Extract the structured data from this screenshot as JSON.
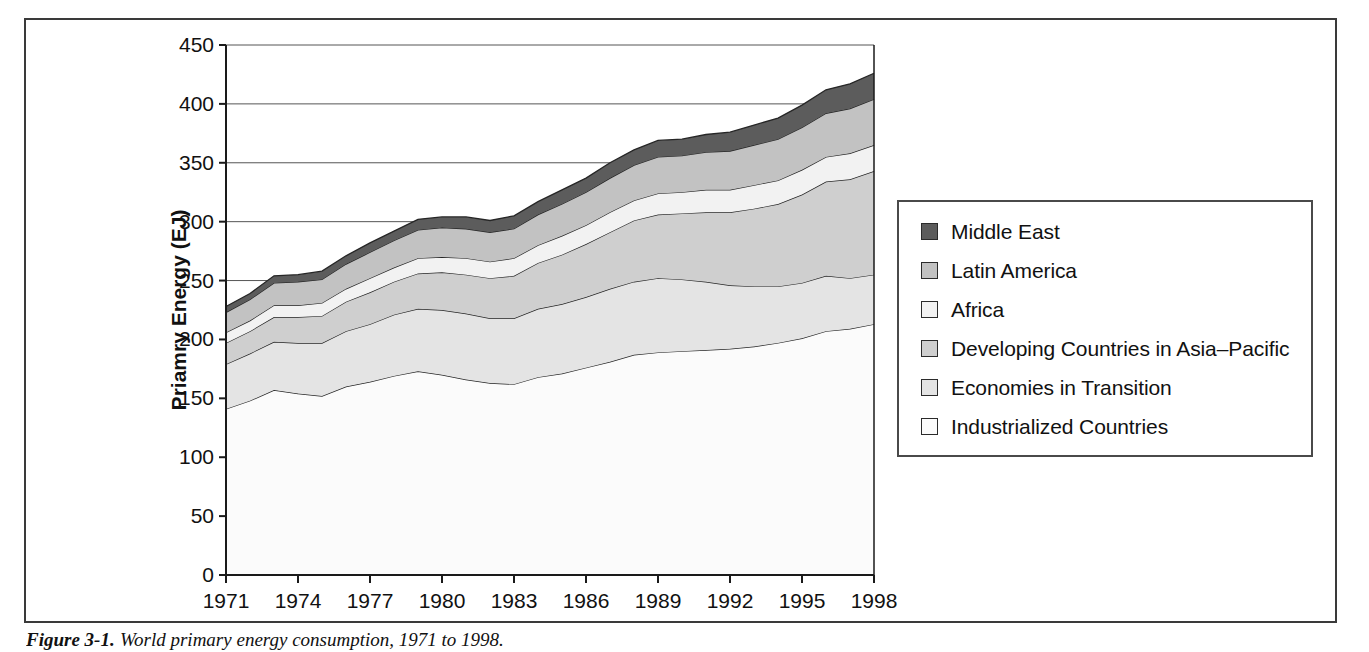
{
  "figure": {
    "caption_number": "Figure 3-1.",
    "caption_text": "World primary energy consumption, 1971 to 1998."
  },
  "legend": {
    "items": [
      {
        "label": "Middle East",
        "color": "#5c5c5c"
      },
      {
        "label": "Latin America",
        "color": "#c2c2c2"
      },
      {
        "label": "Africa",
        "color": "#f2f2f2"
      },
      {
        "label": "Developing Countries in Asia–Pacific",
        "color": "#cfcfcf"
      },
      {
        "label": "Economies in Transition",
        "color": "#e4e4e4"
      },
      {
        "label": "Industrialized Countries",
        "color": "#fbfbfb"
      }
    ]
  },
  "chart_data": {
    "type": "area",
    "stacked": true,
    "title": "",
    "xlabel": "",
    "ylabel": "Priamry Energy (EJ)",
    "ylim": [
      0,
      450
    ],
    "ytick_step": 50,
    "yticks": [
      0,
      50,
      100,
      150,
      200,
      250,
      300,
      350,
      400,
      450
    ],
    "xlim": [
      1971,
      1998
    ],
    "xticks": [
      1971,
      1974,
      1977,
      1980,
      1983,
      1986,
      1989,
      1992,
      1995,
      1998
    ],
    "x": [
      1971,
      1972,
      1973,
      1974,
      1975,
      1976,
      1977,
      1978,
      1979,
      1980,
      1981,
      1982,
      1983,
      1984,
      1985,
      1986,
      1987,
      1988,
      1989,
      1990,
      1991,
      1992,
      1993,
      1994,
      1995,
      1996,
      1997,
      1998
    ],
    "grid": "horizontal",
    "legend_position": "right-outside",
    "series": [
      {
        "name": "Industrialized Countries",
        "color": "#fbfbfb",
        "values": [
          141,
          148,
          157,
          154,
          152,
          160,
          164,
          169,
          173,
          170,
          166,
          163,
          162,
          168,
          171,
          176,
          181,
          187,
          189,
          190,
          191,
          192,
          194,
          197,
          201,
          207,
          209,
          213
        ]
      },
      {
        "name": "Economies in Transition",
        "color": "#e4e4e4",
        "values": [
          38,
          40,
          41,
          43,
          45,
          47,
          49,
          52,
          53,
          55,
          56,
          55,
          56,
          58,
          59,
          60,
          62,
          62,
          63,
          61,
          58,
          54,
          51,
          48,
          47,
          47,
          43,
          42
        ]
      },
      {
        "name": "Developing Countries in Asia–Pacific",
        "color": "#cfcfcf",
        "values": [
          18,
          19,
          21,
          22,
          23,
          25,
          27,
          28,
          30,
          32,
          33,
          34,
          36,
          39,
          42,
          45,
          48,
          52,
          54,
          56,
          59,
          62,
          66,
          70,
          75,
          80,
          84,
          88
        ]
      },
      {
        "name": "Africa",
        "color": "#f2f2f2",
        "values": [
          9,
          9,
          10,
          10,
          11,
          11,
          12,
          12,
          13,
          13,
          14,
          14,
          15,
          15,
          16,
          16,
          17,
          17,
          18,
          18,
          19,
          19,
          20,
          20,
          21,
          21,
          22,
          22
        ]
      },
      {
        "name": "Latin America",
        "color": "#c2c2c2",
        "values": [
          17,
          18,
          19,
          20,
          20,
          21,
          22,
          23,
          24,
          25,
          25,
          25,
          25,
          26,
          27,
          28,
          29,
          30,
          31,
          31,
          32,
          33,
          34,
          35,
          36,
          37,
          38,
          39
        ]
      },
      {
        "name": "Middle East",
        "color": "#5c5c5c",
        "values": [
          5,
          5,
          6,
          6,
          7,
          7,
          8,
          8,
          9,
          9,
          10,
          10,
          11,
          11,
          12,
          12,
          13,
          13,
          14,
          14,
          15,
          16,
          17,
          18,
          19,
          20,
          21,
          22
        ]
      }
    ]
  }
}
